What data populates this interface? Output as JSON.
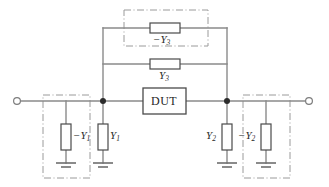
{
  "diagram": {
    "background_color": "#ffffff",
    "wire_color": "#8a8a8a",
    "dashdot_color": "#9a9a9a",
    "component_stroke": "#4a4a4a",
    "node_color": "#2b2b2b"
  },
  "labels": {
    "dut": "DUT",
    "neg_y3": "−Y",
    "neg_y3_sub": "3",
    "y3": "Y",
    "y3_sub": "3",
    "neg_y1": "−Y",
    "neg_y1_sub": "1",
    "y1": "Y",
    "y1_sub": "1",
    "y2": "Y",
    "y2_sub": "2",
    "neg_y2": "−Y",
    "neg_y2_sub": "2"
  },
  "components": {
    "dut_block": "DUT",
    "shunt_left_negative": "-Y1",
    "shunt_left_positive": "Y1",
    "shunt_right_positive": "Y2",
    "shunt_right_negative": "-Y2",
    "series_top_negative": "-Y3",
    "series_mid_positive": "Y3"
  },
  "terminals": {
    "port1": "port-1-terminal",
    "port2": "port-2-terminal"
  },
  "grounds": {
    "count": 4,
    "symbol": "ground-symbol"
  },
  "nodes": {
    "left_node": "junction-left",
    "right_node": "junction-right"
  }
}
